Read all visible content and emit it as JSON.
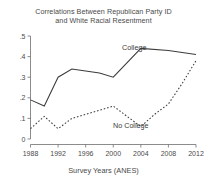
{
  "chart_data": {
    "type": "line",
    "title": "Correlations Between Republican Party ID and White Racial Resentment",
    "title_line1": "Correlations Between Republican Party ID",
    "title_line2": "and White Racial Resentment",
    "xlabel": "Survey Years (ANES)",
    "ylabel": "",
    "xlim": [
      1988,
      2012
    ],
    "ylim": [
      0,
      0.5
    ],
    "grid": false,
    "legend_position": "inline-annotation",
    "ytick_labels": [
      ".5",
      ".4",
      ".3",
      ".2",
      ".1",
      "0"
    ],
    "ytick_values": [
      0.5,
      0.4,
      0.3,
      0.2,
      0.1,
      0
    ],
    "xtick_labels": [
      "1988",
      "1992",
      "1996",
      "2000",
      "2004",
      "2008",
      "2012"
    ],
    "xtick_values": [
      1988,
      1992,
      1996,
      2000,
      2004,
      2008,
      2012
    ],
    "series": [
      {
        "name": "College",
        "style": "solid",
        "annotation": "College",
        "x": [
          1988,
          1990,
          1992,
          1994,
          1996,
          1998,
          2000,
          2004,
          2008,
          2012
        ],
        "values": [
          0.19,
          0.16,
          0.3,
          0.34,
          0.33,
          0.32,
          0.3,
          0.44,
          0.43,
          0.41
        ]
      },
      {
        "name": "No College",
        "style": "dashed",
        "annotation": "No College",
        "x": [
          1988,
          1990,
          1992,
          1994,
          1996,
          1998,
          2000,
          2002,
          2004,
          2006,
          2008,
          2010,
          2012
        ],
        "values": [
          0.05,
          0.11,
          0.05,
          0.1,
          0.12,
          0.14,
          0.16,
          0.11,
          0.06,
          0.12,
          0.17,
          0.27,
          0.38
        ]
      }
    ]
  },
  "colors": {
    "line": "#3c3c3c",
    "axis": "#6e6e6e",
    "text": "#4a4a4a",
    "background": "#ffffff"
  }
}
